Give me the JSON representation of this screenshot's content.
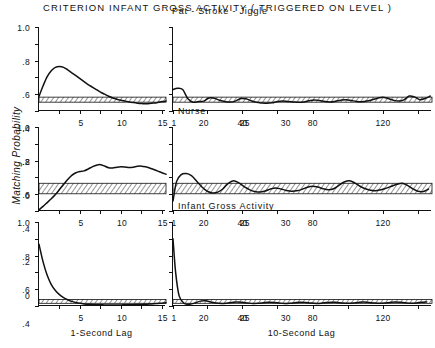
{
  "figure": {
    "title": "CRITERION INFANT GROSS ACTIVITY ( TRIGGERED ON LEVEL )",
    "ylabel": "Matching Probability",
    "xlabel_left": "1-Second Lag",
    "xlabel_right": "10-Second Lag"
  },
  "chart_data": {
    "type": "line",
    "title": "CRITERION INFANT GROSS ACTIVITY ( TRIGGERED ON LEVEL )",
    "ylabel": "Matching Probability",
    "grid": false,
    "legend": "none",
    "ylim": [
      0,
      1.0
    ],
    "yticks": [
      1.0,
      0.8,
      0.6,
      0.4,
      0.2,
      0
    ],
    "yticklabels": [
      "1.0",
      ".8",
      ".6",
      ".4",
      ".2",
      "0"
    ],
    "panels": [
      {
        "row": 0,
        "panel_title": "Pat - Stroke - Jiggle",
        "left": {
          "xlabel": "1-Second Lag",
          "xlim": [
            0,
            31
          ],
          "xticks": [
            5,
            10,
            15,
            20,
            25,
            30
          ],
          "xticklabels": [
            "5",
            "10",
            "15",
            "20",
            "25",
            "30"
          ],
          "confidence_band": [
            0.105,
            0.165
          ],
          "x": [
            0,
            1,
            2,
            3,
            4,
            5,
            6,
            7,
            8,
            9,
            10,
            11,
            12,
            13,
            14,
            15,
            16,
            17,
            18,
            19,
            20,
            21,
            22,
            23,
            24,
            25,
            26,
            27,
            28,
            29,
            30,
            31
          ],
          "y": [
            0.175,
            0.3,
            0.41,
            0.48,
            0.52,
            0.53,
            0.52,
            0.49,
            0.455,
            0.42,
            0.385,
            0.35,
            0.315,
            0.285,
            0.255,
            0.225,
            0.2,
            0.175,
            0.155,
            0.14,
            0.128,
            0.118,
            0.108,
            0.1,
            0.093,
            0.088,
            0.086,
            0.088,
            0.094,
            0.102,
            0.112,
            0.118
          ]
        },
        "right": {
          "xlabel": "10-Second Lag",
          "xlim": [
            1,
            296
          ],
          "xticks": [
            1,
            40,
            80,
            120,
            160,
            200,
            240,
            280
          ],
          "xticklabels": [
            "1",
            "40",
            "80",
            "120",
            "160",
            "200",
            "240",
            "280"
          ],
          "confidence_band": [
            0.105,
            0.165
          ],
          "x": [
            1,
            6,
            12,
            18,
            24,
            30,
            36,
            42,
            48,
            54,
            60,
            66,
            72,
            78,
            84,
            90,
            96,
            102,
            108,
            114,
            120,
            126,
            132,
            138,
            144,
            150,
            156,
            162,
            168,
            174,
            180,
            186,
            192,
            198,
            204,
            210,
            216,
            222,
            228,
            234,
            240,
            246,
            252,
            258,
            264,
            270,
            276,
            282,
            288,
            294
          ],
          "y": [
            0.255,
            0.27,
            0.255,
            0.145,
            0.105,
            0.112,
            0.118,
            0.155,
            0.152,
            0.128,
            0.112,
            0.106,
            0.118,
            0.148,
            0.145,
            0.122,
            0.104,
            0.096,
            0.092,
            0.098,
            0.112,
            0.118,
            0.112,
            0.108,
            0.104,
            0.108,
            0.122,
            0.132,
            0.124,
            0.112,
            0.108,
            0.116,
            0.128,
            0.135,
            0.126,
            0.114,
            0.11,
            0.118,
            0.135,
            0.152,
            0.165,
            0.148,
            0.128,
            0.118,
            0.132,
            0.178,
            0.168,
            0.135,
            0.148,
            0.178
          ]
        }
      },
      {
        "row": 1,
        "panel_title": "Nurse",
        "left": {
          "xlabel": "1-Second Lag",
          "xlim": [
            0,
            31
          ],
          "xticks": [
            5,
            10,
            15,
            20,
            25,
            30
          ],
          "xticklabels": [
            "5",
            "10",
            "15",
            "20",
            "25",
            "30"
          ],
          "confidence_band": [
            0.205,
            0.33
          ],
          "x": [
            0,
            1,
            2,
            3,
            4,
            5,
            6,
            7,
            8,
            9,
            10,
            11,
            12,
            13,
            14,
            15,
            16,
            17,
            18,
            19,
            20,
            21,
            22,
            23,
            24,
            25,
            26,
            27,
            28,
            29,
            30,
            31
          ],
          "y": [
            0.015,
            0.055,
            0.1,
            0.145,
            0.195,
            0.255,
            0.315,
            0.375,
            0.425,
            0.455,
            0.47,
            0.478,
            0.5,
            0.525,
            0.545,
            0.552,
            0.535,
            0.515,
            0.512,
            0.522,
            0.527,
            0.524,
            0.518,
            0.522,
            0.532,
            0.534,
            0.526,
            0.512,
            0.494,
            0.475,
            0.455,
            0.438
          ]
        },
        "right": {
          "xlabel": "10-Second Lag",
          "xlim": [
            1,
            296
          ],
          "xticks": [
            1,
            40,
            80,
            120,
            160,
            200,
            240,
            280
          ],
          "xticklabels": [
            "1",
            "40",
            "80",
            "120",
            "160",
            "200",
            "240",
            "280"
          ],
          "confidence_band": [
            0.205,
            0.33
          ],
          "x": [
            1,
            5,
            10,
            16,
            22,
            28,
            34,
            40,
            46,
            52,
            58,
            64,
            70,
            76,
            82,
            88,
            94,
            100,
            106,
            112,
            118,
            124,
            130,
            136,
            142,
            148,
            154,
            160,
            166,
            172,
            178,
            184,
            190,
            196,
            202,
            208,
            214,
            220,
            226,
            232,
            238,
            244,
            250,
            256,
            262,
            268,
            274,
            280,
            286,
            292
          ],
          "y": [
            0.12,
            0.35,
            0.43,
            0.445,
            0.42,
            0.355,
            0.285,
            0.235,
            0.215,
            0.225,
            0.265,
            0.33,
            0.36,
            0.335,
            0.29,
            0.255,
            0.232,
            0.225,
            0.238,
            0.262,
            0.275,
            0.262,
            0.245,
            0.235,
            0.24,
            0.258,
            0.282,
            0.295,
            0.285,
            0.265,
            0.252,
            0.265,
            0.305,
            0.345,
            0.36,
            0.335,
            0.295,
            0.265,
            0.248,
            0.242,
            0.252,
            0.272,
            0.295,
            0.318,
            0.33,
            0.305,
            0.265,
            0.235,
            0.232,
            0.262
          ]
        }
      },
      {
        "row": 2,
        "panel_title": "Infant Gross Activity",
        "left": {
          "xlabel": "1-Second Lag",
          "xlim": [
            0,
            31
          ],
          "xticks": [
            5,
            10,
            15,
            20,
            25,
            30
          ],
          "xticklabels": [
            "5",
            "10",
            "15",
            "20",
            "25",
            "30"
          ],
          "confidence_band": [
            0.032,
            0.078
          ],
          "x": [
            0,
            1,
            2,
            3,
            4,
            5,
            6,
            7,
            8,
            9,
            10,
            11,
            12,
            13,
            14,
            15,
            16,
            17,
            18,
            19,
            20,
            21,
            22,
            23,
            24,
            25,
            26,
            27,
            28,
            29,
            30,
            31
          ],
          "y": [
            0.735,
            0.525,
            0.365,
            0.255,
            0.185,
            0.135,
            0.1,
            0.075,
            0.055,
            0.042,
            0.032,
            0.025,
            0.02,
            0.017,
            0.015,
            0.014,
            0.013,
            0.013,
            0.012,
            0.012,
            0.013,
            0.014,
            0.015,
            0.016,
            0.018,
            0.019,
            0.021,
            0.023,
            0.026,
            0.03,
            0.034,
            0.038
          ]
        },
        "right": {
          "xlabel": "10-Second Lag",
          "xlim": [
            1,
            296
          ],
          "xticks": [
            1,
            40,
            80,
            120,
            160,
            200,
            240,
            280
          ],
          "xticklabels": [
            "1",
            "40",
            "80",
            "120",
            "160",
            "200",
            "240",
            "280"
          ],
          "confidence_band": [
            0.032,
            0.078
          ],
          "x": [
            1,
            4,
            8,
            14,
            20,
            26,
            32,
            38,
            44,
            50,
            56,
            62,
            68,
            74,
            80,
            86,
            92,
            98,
            104,
            110,
            116,
            122,
            128,
            134,
            140,
            146,
            152,
            158,
            164,
            170,
            176,
            182,
            188,
            194,
            200,
            206,
            212,
            218,
            224,
            230,
            236,
            242,
            248,
            254,
            260,
            266,
            272,
            278,
            284,
            290
          ],
          "y": [
            0.8,
            0.4,
            0.12,
            0.03,
            0.022,
            0.035,
            0.058,
            0.062,
            0.048,
            0.035,
            0.03,
            0.034,
            0.042,
            0.048,
            0.044,
            0.036,
            0.03,
            0.032,
            0.038,
            0.044,
            0.042,
            0.036,
            0.031,
            0.033,
            0.04,
            0.046,
            0.042,
            0.035,
            0.031,
            0.034,
            0.041,
            0.046,
            0.042,
            0.036,
            0.032,
            0.035,
            0.042,
            0.047,
            0.043,
            0.037,
            0.033,
            0.036,
            0.043,
            0.048,
            0.044,
            0.038,
            0.034,
            0.037,
            0.044,
            0.049
          ]
        }
      }
    ]
  }
}
